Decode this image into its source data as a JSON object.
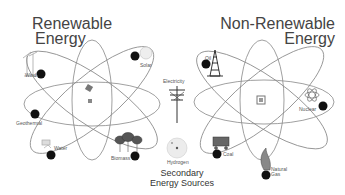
{
  "renewable": {
    "title_line1": "Renewable",
    "title_line2": "Energy",
    "sources": [
      "Wind",
      "Solar",
      "Geothermal",
      "Water",
      "Biomass"
    ]
  },
  "non_renewable": {
    "title_line1": "Non-Renewable",
    "title_line2": "Energy",
    "sources": [
      "Oil",
      "Nuclear",
      "Coal",
      "Natural Gas"
    ]
  },
  "secondary": {
    "title_line1": "Secondary",
    "title_line2": "Energy Sources",
    "sources": [
      "Electricity",
      "Hydrogen"
    ]
  },
  "colors": {
    "orbit": "#777777",
    "electron": "#111111",
    "text": "#444444"
  }
}
